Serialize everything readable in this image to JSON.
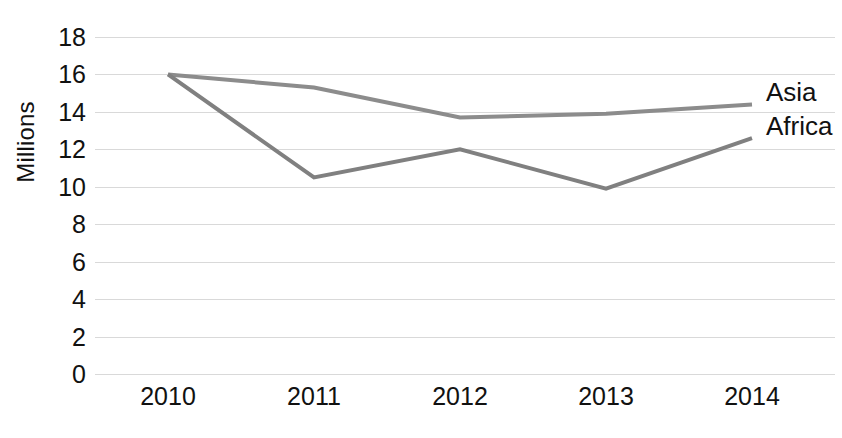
{
  "chart_data": {
    "type": "line",
    "title": "",
    "xlabel": "",
    "ylabel": "Millions",
    "categories": [
      "2010",
      "2011",
      "2012",
      "2013",
      "2014"
    ],
    "ylim": [
      0,
      18
    ],
    "ytick_step": 2,
    "yticks": [
      "18",
      "16",
      "14",
      "12",
      "10",
      "8",
      "6",
      "4",
      "2",
      "0"
    ],
    "grid": "horizontal",
    "legend_position": "end-of-line-right",
    "series": [
      {
        "name": "Asia",
        "color": "#8c8c8c",
        "values": [
          16.0,
          15.3,
          13.7,
          13.9,
          14.4
        ]
      },
      {
        "name": "Africa",
        "color": "#808080",
        "values": [
          16.0,
          10.5,
          12.0,
          9.9,
          12.6
        ]
      }
    ]
  },
  "style": {
    "line_width": 4,
    "gridline_color": "#d9d9d9",
    "text_color": "#111111",
    "background": "#ffffff"
  }
}
